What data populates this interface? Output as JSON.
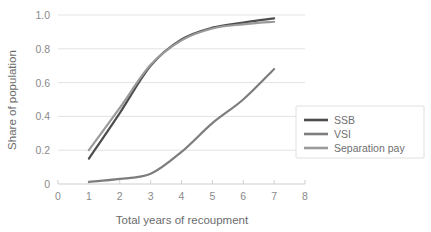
{
  "chart_data": {
    "type": "line",
    "title": "",
    "xlabel": "Total years of recoupment",
    "ylabel": "Share of population",
    "x": [
      1,
      2,
      3,
      4,
      5,
      6,
      7
    ],
    "xlim": [
      0,
      8
    ],
    "ylim": [
      0,
      1.0
    ],
    "xticks": [
      "0",
      "1",
      "2",
      "3",
      "4",
      "5",
      "6",
      "7",
      "8"
    ],
    "yticks": [
      "0",
      "0.2",
      "0.4",
      "0.6",
      "0.8",
      "1.0"
    ],
    "ytick_values": [
      0,
      0.2,
      0.4,
      0.6,
      0.8,
      1.0
    ],
    "xtick_values": [
      0,
      1,
      2,
      3,
      4,
      5,
      6,
      7,
      8
    ],
    "grid": "horizontal",
    "legend_position": "right",
    "series": [
      {
        "name": "SSB",
        "color": "#4d4d4d",
        "values": [
          0.15,
          0.42,
          0.7,
          0.855,
          0.925,
          0.955,
          0.98
        ]
      },
      {
        "name": "VSI",
        "color": "#7d7d7d",
        "values": [
          0.012,
          0.03,
          0.06,
          0.19,
          0.36,
          0.5,
          0.68
        ]
      },
      {
        "name": "Separation pay",
        "color": "#9a9a9a",
        "values": [
          0.2,
          0.45,
          0.705,
          0.85,
          0.92,
          0.945,
          0.96
        ]
      }
    ]
  },
  "legend": {
    "items": [
      {
        "label": "SSB"
      },
      {
        "label": "VSI"
      },
      {
        "label": "Separation pay"
      }
    ]
  },
  "colors": {
    "grid": "#e3e3e3",
    "axis": "#cfcfcf",
    "tick_text": "#8a8a8a",
    "label_text": "#6b6b6b",
    "legend_border": "#e0e0e0",
    "legend_bg": "#ffffff"
  }
}
